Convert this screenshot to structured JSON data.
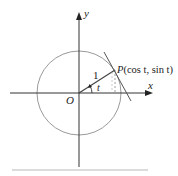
{
  "diagram": {
    "labels": {
      "y_axis": "y",
      "x_axis": "x",
      "origin": "O",
      "radius": "1",
      "angle": "t",
      "point_prefix": "P",
      "point_coords": "(cos t, sin t)"
    },
    "colors": {
      "axes": "#333333",
      "circle": "#999999",
      "radius_line": "#444444",
      "tangent": "#555555",
      "dashed": "#888888",
      "rule": "#d0d0d0"
    }
  }
}
